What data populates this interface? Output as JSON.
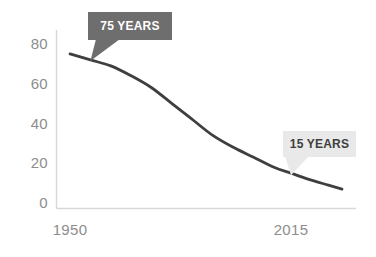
{
  "chart_data": {
    "type": "line",
    "title": "",
    "subtitle": "",
    "xlabel": "",
    "ylabel": "",
    "grid": false,
    "legend": false,
    "xlim": [
      1950,
      2030
    ],
    "ylim": [
      0,
      80
    ],
    "x_tick_labels": [
      "1950",
      "2015"
    ],
    "x_tick_values": [
      1950,
      2015
    ],
    "y_tick_labels": [
      "0",
      "20",
      "40",
      "60",
      "80"
    ],
    "y_tick_values": [
      0,
      20,
      40,
      60,
      80
    ],
    "series": [
      {
        "name": "Average lifespan",
        "color": "#3f3f3f",
        "x": [
          1950,
          1956,
          1962,
          1968,
          1974,
          1980,
          1986,
          1992,
          1998,
          2004,
          2010,
          2015,
          2020,
          2026,
          2030
        ],
        "values": [
          75,
          72,
          69,
          64,
          58,
          50,
          42,
          34,
          28,
          23,
          18,
          15,
          12,
          9,
          7
        ]
      }
    ],
    "annotations": [
      {
        "id": "annotation-75-years",
        "label": "75 YEARS",
        "style": "dark",
        "background": "#6e6e6e",
        "text_color": "#ffffff",
        "point_year": 1956,
        "point_value": 72
      },
      {
        "id": "annotation-15-years",
        "label": "15 YEARS",
        "style": "light",
        "background": "#e9e9e9",
        "text_color": "#3f3f3f",
        "point_year": 2015,
        "point_value": 15
      }
    ],
    "axis_color": "#d8d8d8",
    "tick_label_color": "#8d8d8d",
    "background": "#ffffff"
  }
}
